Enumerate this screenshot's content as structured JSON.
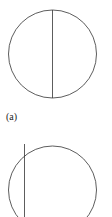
{
  "figures": [
    {
      "label": "(a)",
      "description": "circle with vertical diameter"
    },
    {
      "label": "",
      "description": "circle with vertical chord near left edge extending above"
    }
  ],
  "colors": {
    "stroke": "#333333",
    "background": "#ffffff"
  }
}
